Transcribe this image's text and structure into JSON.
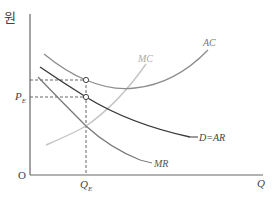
{
  "diagram": {
    "type": "monopoly-equilibrium",
    "y_axis_label": "원",
    "x_axis_label": "Q",
    "origin_label": "O",
    "price_label": {
      "main": "P",
      "sub": "E"
    },
    "quantity_label": {
      "main": "Q",
      "sub": "E"
    },
    "curves": [
      {
        "id": "ac",
        "label": "AC",
        "color": "#8c8c8c"
      },
      {
        "id": "mc",
        "label": "MC",
        "color": "#c4c4c4"
      },
      {
        "id": "demand",
        "label": "D = AR",
        "color": "#3a3a3a"
      },
      {
        "id": "mr",
        "label": "MR",
        "color": "#7a7a7a"
      }
    ],
    "points": [
      {
        "id": "ac-at-qe",
        "description": "AC at Q_E"
      },
      {
        "id": "price-at-qe",
        "description": "Demand at Q_E (P_E)"
      }
    ]
  },
  "labels": {
    "ac": "AC",
    "mc": "MC",
    "demand": "D=AR",
    "mr": "MR"
  }
}
